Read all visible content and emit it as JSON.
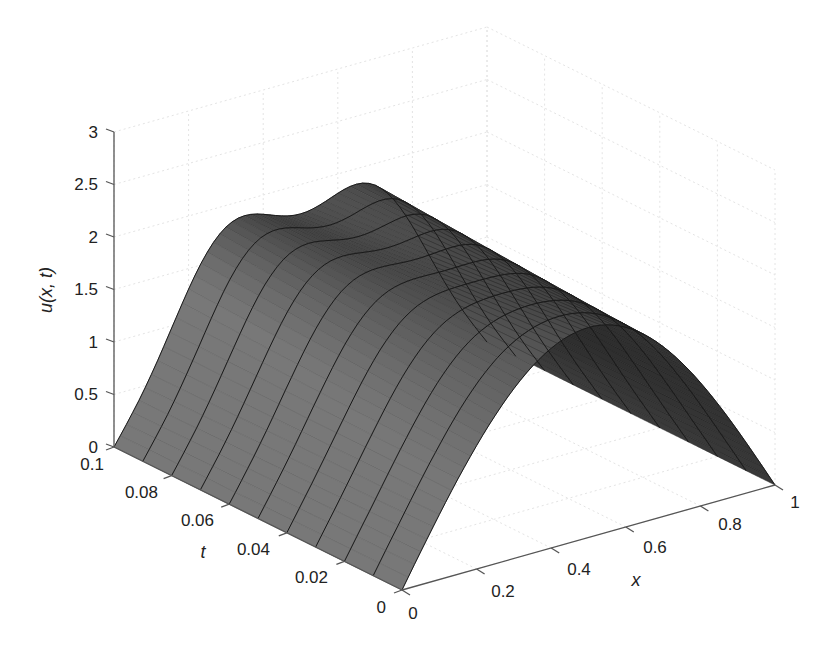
{
  "chart_data": {
    "type": "surface",
    "title": "",
    "xlabel": "x",
    "ylabel": "t",
    "zlabel": "u(x, t)",
    "x_ticks": [
      "0",
      "0.2",
      "0.4",
      "0.6",
      "0.8",
      "1"
    ],
    "t_ticks": [
      "0",
      "0.02",
      "0.04",
      "0.06",
      "0.08",
      "0.1"
    ],
    "z_ticks": [
      "0",
      "0.5",
      "1",
      "1.5",
      "2",
      "2.5",
      "3"
    ],
    "xlim": [
      0,
      1
    ],
    "tlim": [
      0,
      0.1
    ],
    "zlim": [
      0,
      3
    ],
    "grid": true,
    "colormap": "grayscale",
    "profiles": [
      {
        "t": 0.0,
        "x": [
          0,
          0.1,
          0.2,
          0.3,
          0.4,
          0.5,
          0.6,
          0.7,
          0.8,
          0.9,
          1.0
        ],
        "u": [
          0,
          0.62,
          1.18,
          1.62,
          1.9,
          2.0,
          1.9,
          1.62,
          1.18,
          0.62,
          0
        ]
      },
      {
        "t": 0.05,
        "x": [
          0,
          0.1,
          0.2,
          0.3,
          0.4,
          0.5,
          0.6,
          0.7,
          0.8,
          0.9,
          1.0
        ],
        "u": [
          0,
          0.7,
          1.3,
          1.72,
          1.88,
          1.9,
          1.88,
          1.72,
          1.3,
          0.7,
          0
        ]
      },
      {
        "t": 0.1,
        "x": [
          0,
          0.1,
          0.2,
          0.3,
          0.4,
          0.5,
          0.6,
          0.7,
          0.8,
          0.9,
          1.0
        ],
        "u": [
          0,
          0.78,
          1.42,
          1.8,
          1.82,
          1.72,
          1.82,
          1.8,
          1.42,
          0.78,
          0
        ]
      }
    ]
  }
}
